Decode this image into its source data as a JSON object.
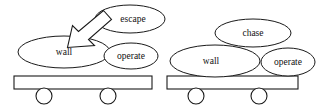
{
  "canvas": {
    "width": 330,
    "height": 111,
    "background": "#ffffff",
    "stroke_color": "#1a1a1a",
    "text_color": "#111111"
  },
  "diagrams": [
    {
      "id": "left-cart",
      "name": "cart-with-escape-arrow",
      "nodes": [
        {
          "id": "escape",
          "label": "escape",
          "cx": 130,
          "cy": 19,
          "rx": 35,
          "ry": 14
        },
        {
          "id": "wall",
          "label": "wall",
          "cx": 64,
          "cy": 52,
          "rx": 46,
          "ry": 16
        },
        {
          "id": "operate",
          "label": "operate",
          "cx": 131,
          "cy": 56,
          "rx": 27,
          "ry": 13
        }
      ],
      "chassis": {
        "x": 14,
        "y": 76,
        "width": 138,
        "height": 13
      },
      "wheels": [
        {
          "cx": 44,
          "cy": 96,
          "r": 8
        },
        {
          "cx": 108,
          "cy": 96,
          "r": 8
        }
      ],
      "arrow": {
        "name": "escape-to-wall-arrow",
        "from": "escape",
        "to": "wall",
        "direction": "down-left",
        "style": "hollow-block-arrow"
      }
    },
    {
      "id": "right-cart",
      "name": "cart-with-chase",
      "nodes": [
        {
          "id": "chase",
          "label": "chase",
          "cx": 253,
          "cy": 33,
          "rx": 38,
          "ry": 14
        },
        {
          "id": "wall",
          "label": "wall",
          "cx": 215,
          "cy": 61,
          "rx": 45,
          "ry": 16
        },
        {
          "id": "operate",
          "label": "operate",
          "cx": 288,
          "cy": 62,
          "rx": 27,
          "ry": 14
        }
      ],
      "chassis": {
        "x": 167,
        "y": 76,
        "width": 131,
        "height": 13
      },
      "wheels": [
        {
          "cx": 196,
          "cy": 96,
          "r": 8
        },
        {
          "cx": 259,
          "cy": 96,
          "r": 8
        }
      ],
      "arrow": null
    }
  ]
}
